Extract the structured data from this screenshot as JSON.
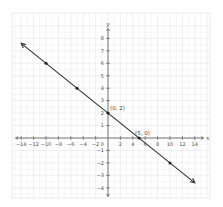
{
  "chart_data": {
    "type": "line",
    "title": "",
    "xlabel": "x",
    "ylabel": "y",
    "xlim": [
      -15.5,
      16
    ],
    "ylim": [
      -5,
      9
    ],
    "grid": true,
    "x_ticks": [
      -14,
      -12,
      -10,
      -8,
      -6,
      -4,
      -2,
      2,
      4,
      6,
      8,
      10,
      12,
      14
    ],
    "y_ticks": [
      -4,
      -3,
      -2,
      -1,
      1,
      2,
      3,
      4,
      5,
      6,
      7,
      8
    ],
    "origin_label": "0",
    "series": [
      {
        "name": "line",
        "equation": "y = -0.4x + 2",
        "color": "#333333",
        "x": [
          -14,
          14
        ],
        "y": [
          7.6,
          -3.6
        ],
        "arrows_both_ends": true
      }
    ],
    "points": [
      {
        "x": -10,
        "y": 6,
        "label": ""
      },
      {
        "x": -5,
        "y": 4,
        "label": ""
      },
      {
        "x": 0,
        "y": 2,
        "label": "(0, 2)"
      },
      {
        "x": 5,
        "y": 0,
        "label": "(5, 0)"
      },
      {
        "x": 10,
        "y": -2,
        "label": ""
      }
    ],
    "colors": {
      "grid": "#e4e4e4",
      "axis": "#555555",
      "line": "#333333",
      "point": "#222222"
    }
  }
}
